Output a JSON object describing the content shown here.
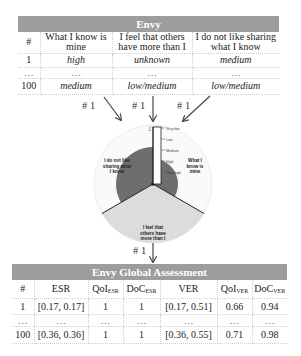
{
  "top_table": {
    "title": "Envy",
    "columns": [
      "#",
      "What I know is mine",
      "I feel that others have more than I",
      "I do not like sharing what I know"
    ],
    "columns_lines": [
      [
        "#"
      ],
      [
        "What I know is",
        "mine"
      ],
      [
        "I feel that others",
        "have more than I"
      ],
      [
        "I do not like sharing",
        "what I know"
      ]
    ],
    "rows": [
      [
        "1",
        "high",
        "unknown",
        "medium"
      ],
      [
        "…",
        "…",
        "…",
        "…"
      ],
      [
        "100",
        "medium",
        "low/medium",
        "low/medium"
      ]
    ]
  },
  "arrows": {
    "labels": [
      "# 1",
      "# 1",
      "# 1",
      "# 1"
    ]
  },
  "radar": {
    "scale_labels": [
      "Very low",
      "Low",
      "Medium",
      "High",
      "Very high"
    ],
    "sectors": [
      {
        "label_lines": [
          "I do not like",
          "sharing what",
          "I know"
        ],
        "level": "medium",
        "fill": "#6e6e6e"
      },
      {
        "label_lines": [
          "What I",
          "know is",
          "mine"
        ],
        "level": "high",
        "fill": "#6e6e6e"
      },
      {
        "label_lines": [
          "I feel that",
          "others have",
          "more than I"
        ],
        "level": "unknown",
        "fill": "#dcdcdc"
      }
    ],
    "colors": {
      "dark": "#6e6e6e",
      "light": "#dcdcdc",
      "outline": "#e6e6e6"
    }
  },
  "bottom_table": {
    "title": "Envy Global Assessment",
    "columns": [
      {
        "base": "#",
        "sub": ""
      },
      {
        "base": "ESR",
        "sub": ""
      },
      {
        "base": "QoI",
        "sub": "ESR"
      },
      {
        "base": "DoC",
        "sub": "ESR"
      },
      {
        "base": "VER",
        "sub": ""
      },
      {
        "base": "QoI",
        "sub": "VER"
      },
      {
        "base": "DoC",
        "sub": "VER"
      }
    ],
    "rows": [
      [
        "1",
        "[0.17, 0.17]",
        "1",
        "1",
        "[0.17, 0.51]",
        "0.66",
        "0.94"
      ],
      [
        "…",
        "…",
        "…",
        "…",
        "…",
        "…",
        "…"
      ],
      [
        "100",
        "[0.36, 0.36]",
        "1",
        "1",
        "[0.36, 0.55]",
        "0.71",
        "0.98"
      ]
    ]
  },
  "colors": {
    "header_bg": "#9d9d9d",
    "header_text": "#ffffff"
  }
}
